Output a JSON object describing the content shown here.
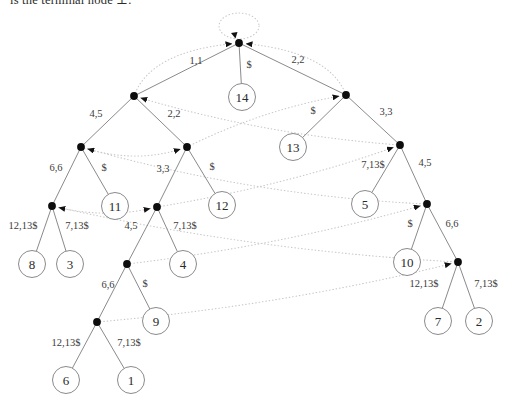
{
  "caption_fragment": "is the terminal node ⊥.",
  "diagram": {
    "type": "suffix-tree-with-suffix-links",
    "colors": {
      "edge": "#7d7d7d",
      "suffix_link": "#c9c9c9",
      "node_fill": "#0d0d0d",
      "leaf_fill": "#ffffff",
      "leaf_stroke": "#7d7d7d",
      "label": "#3c3c3c",
      "arrowhead": "#111111"
    },
    "nodes": [
      {
        "id": "root",
        "x": 239,
        "y": 43,
        "kind": "internal"
      },
      {
        "id": "A",
        "x": 134,
        "y": 96,
        "kind": "internal"
      },
      {
        "id": "B",
        "x": 346,
        "y": 95,
        "kind": "internal"
      },
      {
        "id": "C",
        "x": 81,
        "y": 147,
        "kind": "internal"
      },
      {
        "id": "D",
        "x": 187,
        "y": 147,
        "kind": "internal"
      },
      {
        "id": "E",
        "x": 400,
        "y": 145,
        "kind": "internal"
      },
      {
        "id": "F",
        "x": 52,
        "y": 206,
        "kind": "internal"
      },
      {
        "id": "G",
        "x": 157,
        "y": 207,
        "kind": "internal"
      },
      {
        "id": "H",
        "x": 427,
        "y": 204,
        "kind": "internal"
      },
      {
        "id": "I",
        "x": 127,
        "y": 264,
        "kind": "internal"
      },
      {
        "id": "J",
        "x": 458,
        "y": 262,
        "kind": "internal"
      },
      {
        "id": "K",
        "x": 97,
        "y": 322,
        "kind": "internal"
      },
      {
        "id": "L14",
        "x": 242,
        "y": 97,
        "kind": "leaf",
        "label": "14"
      },
      {
        "id": "L13",
        "x": 293,
        "y": 147,
        "kind": "leaf",
        "label": "13"
      },
      {
        "id": "L11",
        "x": 115,
        "y": 206,
        "kind": "leaf",
        "label": "11"
      },
      {
        "id": "L12",
        "x": 222,
        "y": 205,
        "kind": "leaf",
        "label": "12"
      },
      {
        "id": "L5",
        "x": 365,
        "y": 204,
        "kind": "leaf",
        "label": "5"
      },
      {
        "id": "L8",
        "x": 32,
        "y": 264,
        "kind": "leaf",
        "label": "8"
      },
      {
        "id": "L3",
        "x": 70,
        "y": 264,
        "kind": "leaf",
        "label": "3"
      },
      {
        "id": "L4",
        "x": 183,
        "y": 264,
        "kind": "leaf",
        "label": "4"
      },
      {
        "id": "L10",
        "x": 407,
        "y": 262,
        "kind": "leaf",
        "label": "10"
      },
      {
        "id": "L9",
        "x": 156,
        "y": 321,
        "kind": "leaf",
        "label": "9"
      },
      {
        "id": "L7",
        "x": 438,
        "y": 321,
        "kind": "leaf",
        "label": "7"
      },
      {
        "id": "L2",
        "x": 479,
        "y": 321,
        "kind": "leaf",
        "label": "2"
      },
      {
        "id": "L6",
        "x": 66,
        "y": 380,
        "kind": "leaf",
        "label": "6"
      },
      {
        "id": "L1",
        "x": 131,
        "y": 380,
        "kind": "leaf",
        "label": "1"
      }
    ],
    "edges": [
      {
        "from": "root",
        "to": "A",
        "label": "1,1",
        "lx": 196,
        "ly": 64
      },
      {
        "from": "root",
        "to": "L14",
        "label": "$",
        "lx": 249,
        "ly": 68
      },
      {
        "from": "root",
        "to": "B",
        "label": "2,2",
        "lx": 298,
        "ly": 63
      },
      {
        "from": "A",
        "to": "C",
        "label": "4,5",
        "lx": 96,
        "ly": 117
      },
      {
        "from": "A",
        "to": "D",
        "label": "2,2",
        "lx": 174,
        "ly": 117
      },
      {
        "from": "B",
        "to": "L13",
        "label": "$",
        "lx": 313,
        "ly": 114
      },
      {
        "from": "B",
        "to": "E",
        "label": "3,3",
        "lx": 386,
        "ly": 115
      },
      {
        "from": "C",
        "to": "F",
        "label": "6,6",
        "lx": 56,
        "ly": 171
      },
      {
        "from": "C",
        "to": "L11",
        "label": "$",
        "lx": 104,
        "ly": 171
      },
      {
        "from": "D",
        "to": "G",
        "label": "3,3",
        "lx": 163,
        "ly": 172
      },
      {
        "from": "D",
        "to": "L12",
        "label": "$",
        "lx": 212,
        "ly": 170
      },
      {
        "from": "E",
        "to": "L5",
        "label": "7,13$",
        "lx": 373,
        "ly": 168
      },
      {
        "from": "E",
        "to": "H",
        "label": "4,5",
        "lx": 425,
        "ly": 166
      },
      {
        "from": "F",
        "to": "L8",
        "label": "12,13$",
        "lx": 23,
        "ly": 229
      },
      {
        "from": "F",
        "to": "L3",
        "label": "7,13$",
        "lx": 77,
        "ly": 229
      },
      {
        "from": "G",
        "to": "I",
        "label": "4,5",
        "lx": 131,
        "ly": 229
      },
      {
        "from": "G",
        "to": "L4",
        "label": "7,13$",
        "lx": 185,
        "ly": 229
      },
      {
        "from": "H",
        "to": "L10",
        "label": "$",
        "lx": 410,
        "ly": 227
      },
      {
        "from": "H",
        "to": "J",
        "label": "6,6",
        "lx": 452,
        "ly": 227
      },
      {
        "from": "I",
        "to": "K",
        "label": "6,6",
        "lx": 108,
        "ly": 288
      },
      {
        "from": "I",
        "to": "L9",
        "label": "$",
        "lx": 145,
        "ly": 287
      },
      {
        "from": "J",
        "to": "L7",
        "label": "12,13$",
        "lx": 424,
        "ly": 287
      },
      {
        "from": "J",
        "to": "L2",
        "label": "7,13$",
        "lx": 486,
        "ly": 287
      },
      {
        "from": "K",
        "to": "L6",
        "label": "12,13$",
        "lx": 66,
        "ly": 346
      },
      {
        "from": "K",
        "to": "L1",
        "label": "7,13$",
        "lx": 129,
        "ly": 346
      }
    ],
    "suffix_links": [
      {
        "from": "A",
        "to": "root",
        "cx": 150,
        "cy": 52
      },
      {
        "from": "B",
        "to": "root",
        "cx": 330,
        "cy": 52
      },
      {
        "from": "C",
        "to": "D",
        "cx": 134,
        "cy": 164
      },
      {
        "from": "D",
        "to": "B",
        "cx": 262,
        "cy": 110
      },
      {
        "from": "E",
        "to": "A",
        "cx": 265,
        "cy": 135
      },
      {
        "from": "F",
        "to": "G",
        "cx": 104,
        "cy": 219
      },
      {
        "from": "G",
        "to": "E",
        "cx": 285,
        "cy": 186
      },
      {
        "from": "H",
        "to": "C",
        "cx": 255,
        "cy": 196
      },
      {
        "from": "I",
        "to": "H",
        "cx": 280,
        "cy": 246
      },
      {
        "from": "J",
        "to": "F",
        "cx": 255,
        "cy": 251
      },
      {
        "from": "K",
        "to": "J",
        "cx": 280,
        "cy": 306
      }
    ],
    "root_loop": {
      "cx": 239,
      "cy": 26,
      "rx": 20,
      "ry": 13
    }
  }
}
